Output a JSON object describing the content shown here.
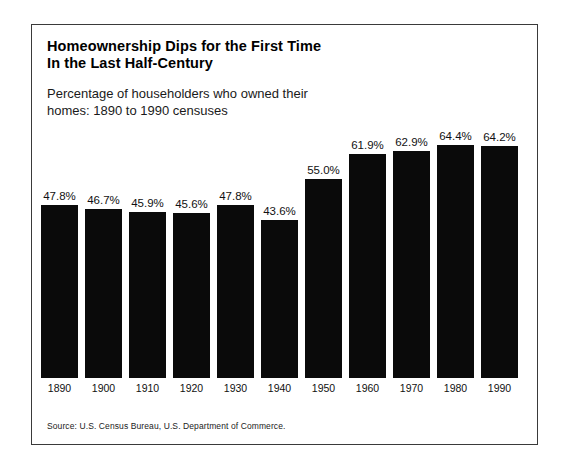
{
  "figure": {
    "title": "Homeownership Dips for the First Time\nIn the Last Half-Century",
    "subtitle": "Percentage of householders who owned their\nhomes:  1890 to 1990 censuses",
    "source": "Source:  U.S. Census Bureau, U.S. Department of Commerce.",
    "frame_color": "#3a3a3a",
    "bar_color": "#0a0a0a",
    "background_color": "#ffffff"
  },
  "chart_data": {
    "type": "bar",
    "title": "Homeownership Dips for the First Time In the Last Half-Century",
    "subtitle": "Percentage of householders who owned their homes:  1890 to 1990 censuses",
    "xlabel": "",
    "ylabel": "",
    "ylim": [
      0,
      70
    ],
    "grid": false,
    "legend": "none",
    "categories": [
      "1890",
      "1900",
      "1910",
      "1920",
      "1930",
      "1940",
      "1950",
      "1960",
      "1970",
      "1980",
      "1990"
    ],
    "values": [
      47.8,
      46.7,
      45.9,
      45.6,
      47.8,
      43.6,
      55.0,
      61.9,
      62.9,
      64.4,
      64.2
    ],
    "value_labels": [
      "47.8%",
      "46.7%",
      "45.9%",
      "45.6%",
      "47.8%",
      "43.6%",
      "55.0%",
      "61.9%",
      "62.9%",
      "64.4%",
      "64.2%"
    ],
    "annotations": [
      "Source:  U.S. Census Bureau, U.S. Department of Commerce."
    ]
  }
}
